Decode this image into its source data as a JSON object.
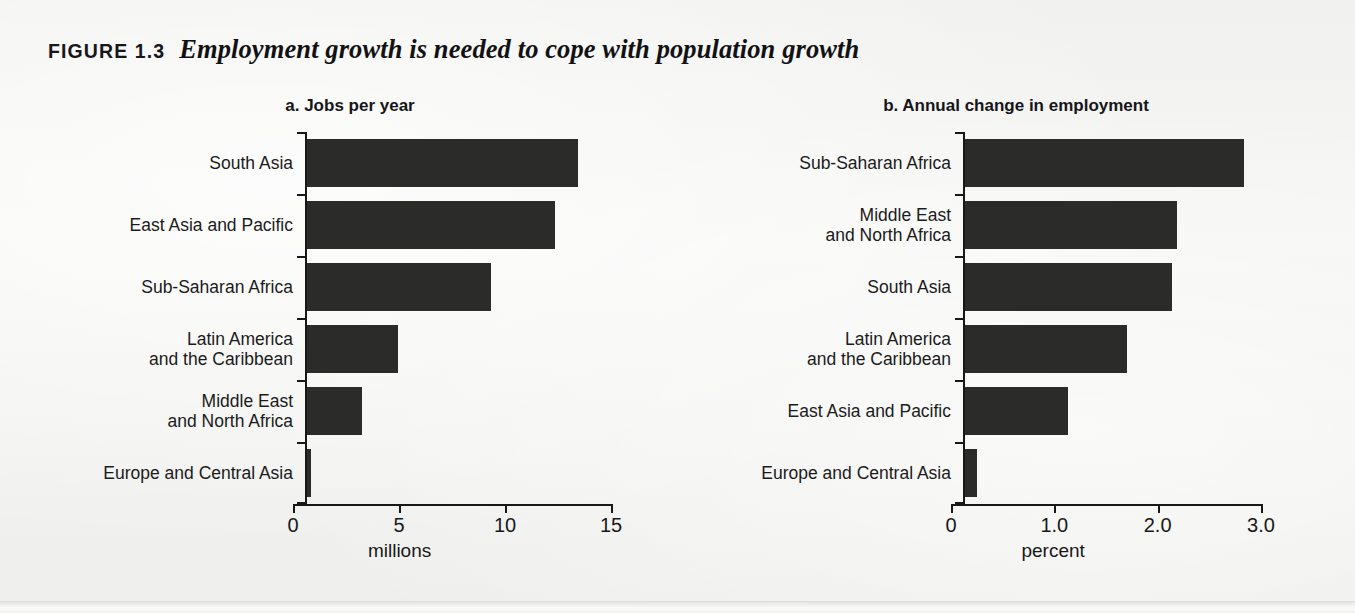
{
  "figure": {
    "kicker": "FIGURE 1.3",
    "title": "Employment growth is needed to cope with population growth"
  },
  "chart_data": [
    {
      "type": "bar",
      "orientation": "horizontal",
      "panel": "a",
      "title": "a.  Jobs per year",
      "categories": [
        "South Asia",
        "East Asia and Pacific",
        "Sub-Saharan Africa",
        "Latin America\nand the Caribbean",
        "Middle East\nand North Africa",
        "Europe and Central Asia"
      ],
      "values": [
        12.8,
        11.7,
        8.7,
        4.3,
        2.6,
        0.2
      ],
      "xlabel": "millions",
      "ylabel": "",
      "xlim": [
        0,
        15
      ],
      "xticks": [
        0,
        5,
        10,
        15
      ],
      "xticklabels": [
        "0",
        "5",
        "10",
        "15"
      ],
      "grid": false,
      "legend": false,
      "bar_color": "#2b2b29"
    },
    {
      "type": "bar",
      "orientation": "horizontal",
      "panel": "b",
      "title": "b.  Annual change in employment",
      "categories": [
        "Sub-Saharan Africa",
        "Middle East\nand North Africa",
        "South Asia",
        "Latin America\nand the Caribbean",
        "East Asia and Pacific",
        "Europe and Central Asia"
      ],
      "values": [
        2.7,
        2.05,
        2.0,
        1.57,
        1.0,
        0.12
      ],
      "xlabel": "percent",
      "ylabel": "",
      "xlim": [
        0,
        3.0
      ],
      "xticks": [
        0,
        1.0,
        2.0,
        3.0
      ],
      "xticklabels": [
        "0",
        "1.0",
        "2.0",
        "3.0"
      ],
      "grid": false,
      "legend": false,
      "bar_color": "#2b2b29"
    }
  ]
}
